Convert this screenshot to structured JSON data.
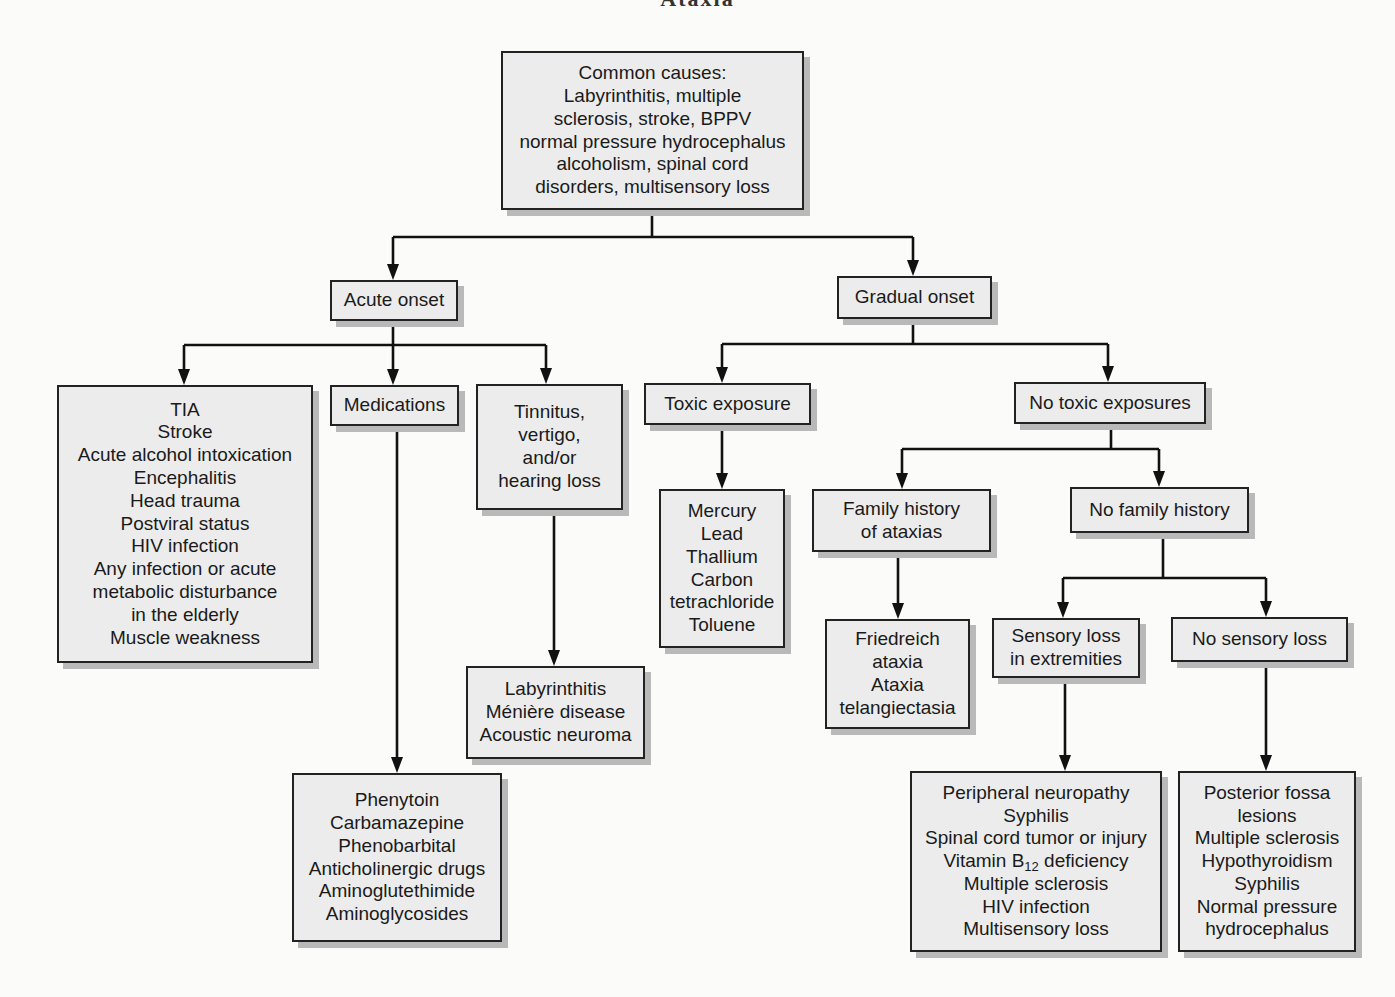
{
  "title": "Ataxia",
  "nodes": {
    "root": {
      "lines": [
        "Common causes:",
        "Labyrinthitis, multiple",
        "sclerosis, stroke, BPPV",
        "normal pressure hydrocephalus",
        "alcoholism, spinal cord",
        "disorders, multisensory loss"
      ]
    },
    "acute_onset": {
      "lines": [
        "Acute onset"
      ]
    },
    "gradual_onset": {
      "lines": [
        "Gradual onset"
      ]
    },
    "acute_general": {
      "lines": [
        "TIA",
        "Stroke",
        "Acute alcohol intoxication",
        "Encephalitis",
        "Head trauma",
        "Postviral status",
        "HIV infection",
        "Any infection or acute",
        "metabolic disturbance",
        "in the elderly",
        "Muscle weakness"
      ]
    },
    "medications": {
      "lines": [
        "Medications"
      ]
    },
    "medication_list": {
      "lines": [
        "Phenytoin",
        "Carbamazepine",
        "Phenobarbital",
        "Anticholinergic drugs",
        "Aminoglutethimide",
        "Aminoglycosides"
      ]
    },
    "tinnitus": {
      "lines": [
        "Tinnitus,",
        "vertigo,",
        "and/or",
        "hearing loss"
      ]
    },
    "tinnitus_causes": {
      "lines": [
        "Labyrinthitis",
        "Ménière disease",
        "Acoustic neuroma"
      ]
    },
    "toxic_exposure": {
      "lines": [
        "Toxic exposure"
      ]
    },
    "toxin_list": {
      "lines": [
        "Mercury",
        "Lead",
        "Thallium",
        "Carbon",
        "tetrachloride",
        "Toluene"
      ]
    },
    "no_toxic_exposures": {
      "lines": [
        "No toxic exposures"
      ]
    },
    "family_history": {
      "lines": [
        "Family history",
        "of ataxias"
      ]
    },
    "hereditary_list": {
      "lines": [
        "Friedreich",
        "ataxia",
        "Ataxia",
        "telangiectasia"
      ]
    },
    "no_family_history": {
      "lines": [
        "No family history"
      ]
    },
    "sensory_loss": {
      "lines": [
        "Sensory loss",
        "in extremities"
      ]
    },
    "sensory_causes": {
      "lines": [
        "Peripheral neuropathy",
        "Syphilis",
        "Spinal cord tumor or injury",
        "Vitamin B",
        "Multiple sclerosis",
        "HIV infection",
        "Multisensory loss"
      ],
      "b12_suffix": "12",
      "b12_tail": " deficiency"
    },
    "no_sensory_loss": {
      "lines": [
        "No sensory loss"
      ]
    },
    "no_sensory_causes": {
      "lines": [
        "Posterior fossa",
        "lesions",
        "Multiple sclerosis",
        "Hypothyroidism",
        "Syphilis",
        "Normal pressure",
        "hydrocephalus"
      ]
    }
  },
  "colors": {
    "box_fill": "#ececec",
    "box_border": "#222222",
    "shadow": "#b9b9b9",
    "line": "#111111",
    "background": "#fbfbfa"
  }
}
